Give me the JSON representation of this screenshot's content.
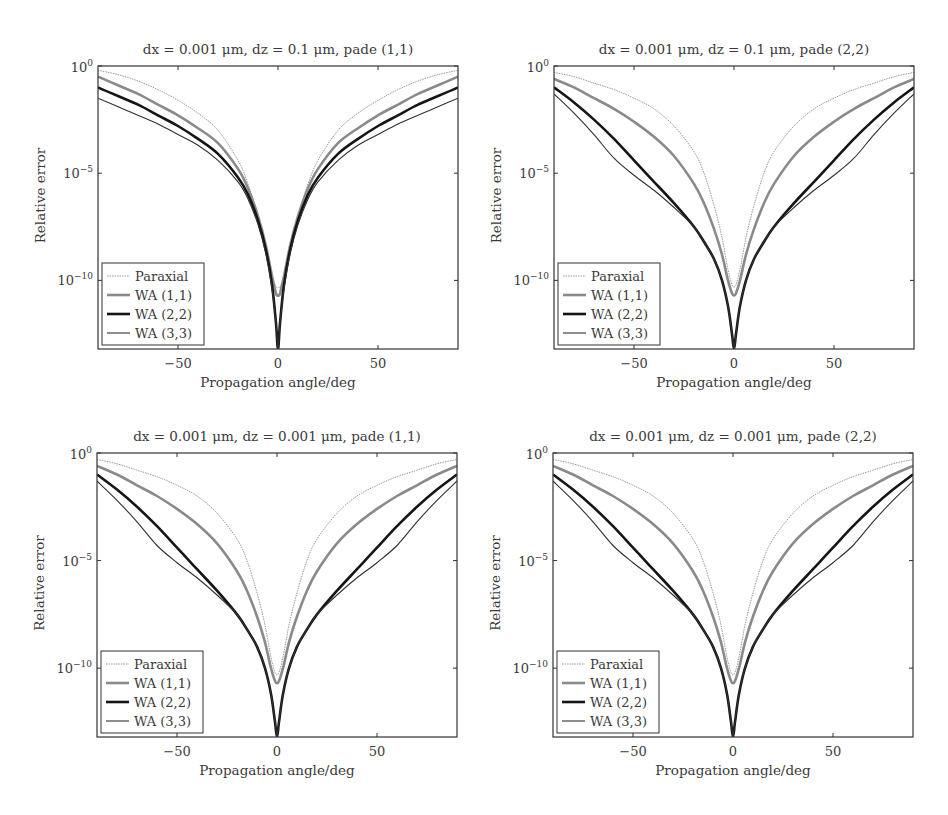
{
  "chart_data": [
    {
      "type": "line",
      "title": "dx = 0.001 μm, dz = 0.1 μm, pade (1,1)",
      "xlabel": "Propagation angle/deg",
      "ylabel": "Relative error",
      "yscale": "log",
      "xlim": [
        -90,
        90
      ],
      "ylim_log10": [
        -13.2,
        0
      ],
      "xticks": [
        -50,
        0,
        50
      ],
      "yticks": [
        "10^0",
        "10^-5",
        "10^-10"
      ],
      "legend_position": "lower left",
      "grid": false,
      "x": [
        -90,
        -80,
        -70,
        -60,
        -50,
        -40,
        -30,
        -20,
        -15,
        -10,
        -6,
        -3,
        -1,
        0,
        1,
        3,
        6,
        10,
        15,
        20,
        30,
        40,
        50,
        60,
        70,
        80,
        90
      ],
      "series": [
        {
          "name": "Paraxial",
          "log10_values": [
            -0.2,
            -0.4,
            -0.7,
            -1.1,
            -1.6,
            -2.2,
            -3.0,
            -4.4,
            -5.5,
            -7.0,
            -8.5,
            -9.8,
            -10.3,
            -10.3,
            -10.3,
            -9.8,
            -8.5,
            -7.0,
            -5.5,
            -4.4,
            -3.0,
            -2.2,
            -1.6,
            -1.1,
            -0.7,
            -0.4,
            -0.2
          ]
        },
        {
          "name": "WA (1,1)",
          "log10_values": [
            -0.5,
            -0.9,
            -1.3,
            -1.8,
            -2.3,
            -2.9,
            -3.6,
            -4.8,
            -5.7,
            -7.0,
            -8.4,
            -9.8,
            -10.6,
            -10.7,
            -10.6,
            -9.8,
            -8.4,
            -7.0,
            -5.7,
            -4.8,
            -3.6,
            -2.9,
            -2.3,
            -1.8,
            -1.3,
            -0.9,
            -0.5
          ]
        },
        {
          "name": "WA (2,2)",
          "log10_values": [
            -1.0,
            -1.4,
            -1.8,
            -2.3,
            -2.8,
            -3.4,
            -4.1,
            -5.2,
            -6.0,
            -7.2,
            -8.6,
            -10.2,
            -12.0,
            -13.2,
            -12.0,
            -10.2,
            -8.6,
            -7.2,
            -6.0,
            -5.2,
            -4.1,
            -3.4,
            -2.8,
            -2.3,
            -1.8,
            -1.4,
            -1.0
          ]
        },
        {
          "name": "WA (3,3)",
          "log10_values": [
            -1.5,
            -1.9,
            -2.3,
            -2.7,
            -3.2,
            -3.7,
            -4.4,
            -5.4,
            -6.2,
            -7.4,
            -8.8,
            -10.4,
            -12.0,
            -13.2,
            -12.0,
            -10.4,
            -8.8,
            -7.4,
            -6.2,
            -5.4,
            -4.4,
            -3.7,
            -3.2,
            -2.7,
            -2.3,
            -1.9,
            -1.5
          ]
        }
      ]
    },
    {
      "type": "line",
      "title": "dx = 0.001 μm, dz = 0.1 μm, pade (2,2)",
      "xlabel": "Propagation angle/deg",
      "ylabel": "Relative error",
      "yscale": "log",
      "xlim": [
        -90,
        90
      ],
      "ylim_log10": [
        -13.2,
        0
      ],
      "xticks": [
        -50,
        0,
        50
      ],
      "yticks": [
        "10^0",
        "10^-5",
        "10^-10"
      ],
      "legend_position": "lower left",
      "grid": false,
      "x": [
        -90,
        -80,
        -70,
        -60,
        -50,
        -40,
        -30,
        -20,
        -15,
        -10,
        -6,
        -3,
        -1,
        0,
        1,
        3,
        6,
        10,
        15,
        20,
        30,
        40,
        50,
        60,
        70,
        80,
        90
      ],
      "series": [
        {
          "name": "Paraxial",
          "log10_values": [
            -0.3,
            -0.5,
            -0.8,
            -1.1,
            -1.5,
            -2.0,
            -2.8,
            -4.0,
            -5.0,
            -6.5,
            -8.0,
            -9.5,
            -10.2,
            -10.3,
            -10.2,
            -9.5,
            -8.0,
            -6.5,
            -5.0,
            -4.0,
            -2.8,
            -2.0,
            -1.5,
            -1.1,
            -0.8,
            -0.5,
            -0.3
          ]
        },
        {
          "name": "WA (1,1)",
          "log10_values": [
            -0.6,
            -1.0,
            -1.5,
            -2.0,
            -2.6,
            -3.3,
            -4.2,
            -5.5,
            -6.4,
            -7.6,
            -8.8,
            -10.0,
            -10.6,
            -10.7,
            -10.6,
            -10.0,
            -8.8,
            -7.6,
            -6.4,
            -5.5,
            -4.2,
            -3.3,
            -2.6,
            -2.0,
            -1.5,
            -1.0,
            -0.6
          ]
        },
        {
          "name": "WA (2,2)",
          "log10_values": [
            -1.0,
            -1.7,
            -2.5,
            -3.4,
            -4.4,
            -5.4,
            -6.4,
            -7.5,
            -8.2,
            -9.0,
            -10.0,
            -11.2,
            -12.5,
            -13.2,
            -12.5,
            -11.2,
            -10.0,
            -9.0,
            -8.2,
            -7.5,
            -6.4,
            -5.4,
            -4.4,
            -3.4,
            -2.5,
            -1.7,
            -1.0
          ]
        },
        {
          "name": "WA (3,3)",
          "log10_values": [
            -1.3,
            -2.2,
            -3.2,
            -4.3,
            -5.1,
            -5.8,
            -6.6,
            -7.5,
            -8.2,
            -9.0,
            -10.0,
            -11.2,
            -12.5,
            -13.2,
            -12.5,
            -11.2,
            -10.0,
            -9.0,
            -8.2,
            -7.5,
            -6.6,
            -5.8,
            -5.1,
            -4.3,
            -3.2,
            -2.2,
            -1.3
          ]
        }
      ]
    },
    {
      "type": "line",
      "title": "dx = 0.001 μm, dz = 0.001 μm, pade (1,1)",
      "xlabel": "Propagation angle/deg",
      "ylabel": "Relative error",
      "yscale": "log",
      "xlim": [
        -90,
        90
      ],
      "ylim_log10": [
        -13.2,
        0
      ],
      "xticks": [
        -50,
        0,
        50
      ],
      "yticks": [
        "10^0",
        "10^-5",
        "10^-10"
      ],
      "legend_position": "lower left",
      "grid": false,
      "x": [
        -90,
        -80,
        -70,
        -60,
        -50,
        -40,
        -30,
        -20,
        -15,
        -10,
        -6,
        -3,
        -1,
        0,
        1,
        3,
        6,
        10,
        15,
        20,
        30,
        40,
        50,
        60,
        70,
        80,
        90
      ],
      "series": [
        {
          "name": "Paraxial",
          "log10_values": [
            -0.3,
            -0.5,
            -0.8,
            -1.1,
            -1.5,
            -2.0,
            -2.8,
            -4.0,
            -5.0,
            -6.5,
            -8.0,
            -9.5,
            -10.2,
            -10.3,
            -10.2,
            -9.5,
            -8.0,
            -6.5,
            -5.0,
            -4.0,
            -2.8,
            -2.0,
            -1.5,
            -1.1,
            -0.8,
            -0.5,
            -0.3
          ]
        },
        {
          "name": "WA (1,1)",
          "log10_values": [
            -0.6,
            -1.0,
            -1.5,
            -2.0,
            -2.6,
            -3.3,
            -4.2,
            -5.5,
            -6.4,
            -7.6,
            -8.8,
            -10.0,
            -10.6,
            -10.7,
            -10.6,
            -10.0,
            -8.8,
            -7.6,
            -6.4,
            -5.5,
            -4.2,
            -3.3,
            -2.6,
            -2.0,
            -1.5,
            -1.0,
            -0.6
          ]
        },
        {
          "name": "WA (2,2)",
          "log10_values": [
            -1.0,
            -1.7,
            -2.5,
            -3.4,
            -4.4,
            -5.4,
            -6.4,
            -7.5,
            -8.2,
            -9.0,
            -10.0,
            -11.2,
            -12.5,
            -13.2,
            -12.5,
            -11.2,
            -10.0,
            -9.0,
            -8.2,
            -7.5,
            -6.4,
            -5.4,
            -4.4,
            -3.4,
            -2.5,
            -1.7,
            -1.0
          ]
        },
        {
          "name": "WA (3,3)",
          "log10_values": [
            -1.3,
            -2.2,
            -3.2,
            -4.3,
            -5.1,
            -5.8,
            -6.6,
            -7.5,
            -8.2,
            -9.0,
            -10.0,
            -11.2,
            -12.5,
            -13.2,
            -12.5,
            -11.2,
            -10.0,
            -9.0,
            -8.2,
            -7.5,
            -6.6,
            -5.8,
            -5.1,
            -4.3,
            -3.2,
            -2.2,
            -1.3
          ]
        }
      ]
    },
    {
      "type": "line",
      "title": "dx = 0.001 μm, dz = 0.001 μm, pade (2,2)",
      "xlabel": "Propagation angle/deg",
      "ylabel": "Relative error",
      "yscale": "log",
      "xlim": [
        -90,
        90
      ],
      "ylim_log10": [
        -13.2,
        0
      ],
      "xticks": [
        -50,
        0,
        50
      ],
      "yticks": [
        "10^0",
        "10^-5",
        "10^-10"
      ],
      "legend_position": "lower left",
      "grid": false,
      "x": [
        -90,
        -80,
        -70,
        -60,
        -50,
        -40,
        -30,
        -20,
        -15,
        -10,
        -6,
        -3,
        -1,
        0,
        1,
        3,
        6,
        10,
        15,
        20,
        30,
        40,
        50,
        60,
        70,
        80,
        90
      ],
      "series": [
        {
          "name": "Paraxial",
          "log10_values": [
            -0.3,
            -0.5,
            -0.8,
            -1.1,
            -1.5,
            -2.0,
            -2.8,
            -4.0,
            -5.0,
            -6.5,
            -8.0,
            -9.5,
            -10.2,
            -10.3,
            -10.2,
            -9.5,
            -8.0,
            -6.5,
            -5.0,
            -4.0,
            -2.8,
            -2.0,
            -1.5,
            -1.1,
            -0.8,
            -0.5,
            -0.3
          ]
        },
        {
          "name": "WA (1,1)",
          "log10_values": [
            -0.6,
            -1.0,
            -1.5,
            -2.0,
            -2.6,
            -3.3,
            -4.2,
            -5.5,
            -6.4,
            -7.6,
            -8.8,
            -10.0,
            -10.6,
            -10.7,
            -10.6,
            -10.0,
            -8.8,
            -7.6,
            -6.4,
            -5.5,
            -4.2,
            -3.3,
            -2.6,
            -2.0,
            -1.5,
            -1.0,
            -0.6
          ]
        },
        {
          "name": "WA (2,2)",
          "log10_values": [
            -1.0,
            -1.7,
            -2.5,
            -3.4,
            -4.4,
            -5.4,
            -6.4,
            -7.5,
            -8.2,
            -9.0,
            -10.0,
            -11.2,
            -12.5,
            -13.2,
            -12.5,
            -11.2,
            -10.0,
            -9.0,
            -8.2,
            -7.5,
            -6.4,
            -5.4,
            -4.4,
            -3.4,
            -2.5,
            -1.7,
            -1.0
          ]
        },
        {
          "name": "WA (3,3)",
          "log10_values": [
            -1.3,
            -2.2,
            -3.2,
            -4.3,
            -5.1,
            -5.8,
            -6.6,
            -7.5,
            -8.2,
            -9.0,
            -10.0,
            -11.2,
            -12.5,
            -13.2,
            -12.5,
            -11.2,
            -10.0,
            -9.0,
            -8.2,
            -7.5,
            -6.6,
            -5.8,
            -5.1,
            -4.3,
            -3.2,
            -2.2,
            -1.3
          ]
        }
      ]
    }
  ],
  "styles": {
    "Paraxial": {
      "color": "#9a9a9a",
      "width": 1.0,
      "dash": "1.5,1"
    },
    "WA (1,1)": {
      "color": "#8a8a8a",
      "width": 2.6,
      "dash": ""
    },
    "WA (2,2)": {
      "color": "#151515",
      "width": 2.6,
      "dash": ""
    },
    "WA (3,3)": {
      "color": "#303030",
      "width": 1.1,
      "dash": ""
    }
  },
  "panels_layout": [
    {
      "left": 98,
      "top": 66,
      "width": 360,
      "height": 283
    },
    {
      "left": 554,
      "top": 66,
      "width": 360,
      "height": 283
    },
    {
      "left": 97,
      "top": 453,
      "width": 360,
      "height": 284
    },
    {
      "left": 553,
      "top": 453,
      "width": 360,
      "height": 284
    }
  ]
}
